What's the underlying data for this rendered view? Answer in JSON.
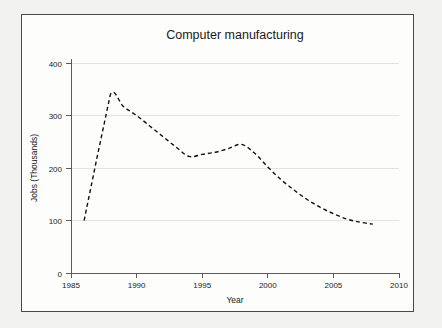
{
  "chart_data": {
    "type": "line",
    "title": "Computer manufacturing",
    "xlabel": "Year",
    "ylabel": "Jobs (Thousands)",
    "xlim": [
      1985,
      2010
    ],
    "ylim": [
      0,
      400
    ],
    "xticks": [
      1985,
      1990,
      1995,
      2000,
      2005,
      2010
    ],
    "xtick_labels": [
      "1985",
      "1990",
      "1995",
      "2000",
      "2005",
      "2010"
    ],
    "yticks": [
      0,
      100,
      200,
      300,
      400
    ],
    "ytick_labels": [
      "0",
      "100",
      "200",
      "300",
      "400"
    ],
    "grid": "horizontal",
    "legend": null,
    "series": [
      {
        "name": "Computer manufacturing jobs",
        "style": "dashed",
        "color": "#111111",
        "x": [
          1986,
          1987,
          1988,
          1989,
          1990,
          1991,
          1992,
          1993,
          1994,
          1995,
          1996,
          1997,
          1998,
          1999,
          2000,
          2001,
          2002,
          2003,
          2004,
          2005,
          2006,
          2007,
          2008
        ],
        "values": [
          100,
          222,
          340,
          317,
          300,
          280,
          260,
          240,
          222,
          226,
          230,
          237,
          245,
          228,
          202,
          178,
          158,
          140,
          125,
          113,
          103,
          97,
          93
        ]
      }
    ]
  },
  "axes": {
    "title_text": "Computer manufacturing",
    "x_axis_title": "Year",
    "y_axis_title": "Jobs (Thousands)"
  },
  "colors": {
    "page_background": "#f2f2f0",
    "panel_background": "#fdfdfb",
    "frame_border": "#4a4a4a",
    "gridline": "#e3e3e3",
    "axis_spine": "#5a5a5a",
    "line_color": "#111111",
    "text_color": "#1a1a1a"
  }
}
